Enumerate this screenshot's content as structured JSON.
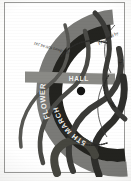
{
  "poster": {
    "orientation_note": "sideways",
    "background_color": "#ffffff",
    "border_color": "#9a9a98",
    "ink_dark": "#2a2a28",
    "ink_mid": "#6f6f6c",
    "ink_light": "#f2f2f0",
    "centre_dot_color": "#141413",
    "bands": [
      {
        "id": "outer-gray-arc",
        "color": "#7a7a77",
        "label": "FLOWER"
      },
      {
        "id": "inner-dark-arc",
        "color": "#23231f",
        "label": "5TH MARCH"
      },
      {
        "id": "vertical-gray-band",
        "color": "#8a8a86",
        "label": "HALL"
      }
    ],
    "curve_labels": [
      {
        "id": "label-left-upper",
        "text": "Nottingham"
      },
      {
        "id": "label-right-upper",
        "text": "Presented by"
      },
      {
        "id": "label-centre",
        "text": "the"
      },
      {
        "id": "label-mid-right",
        "text": "Art"
      },
      {
        "id": "label-lower-right",
        "text": "At the doors  020 84  241"
      }
    ],
    "ribbons": [
      {
        "id": "ribbon-1",
        "color": "#3b3b38"
      },
      {
        "id": "ribbon-2",
        "color": "#4a4a46"
      },
      {
        "id": "ribbon-3",
        "color": "#2e2e2b"
      },
      {
        "id": "ribbon-4",
        "color": "#575753"
      },
      {
        "id": "ribbon-5",
        "color": "#3b3b38"
      },
      {
        "id": "ribbon-6",
        "color": "#46463f"
      }
    ]
  }
}
